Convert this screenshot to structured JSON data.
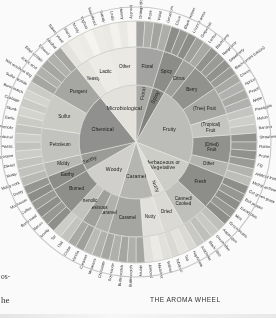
{
  "caption": "THE AROMA WHEEL",
  "page_fragments": {
    "left_top": "os-",
    "left_bottom": "he"
  },
  "colors": {
    "chemical": "#8e8e8c",
    "microbiological": "#e7e5df",
    "floral": "#a9a9a6",
    "spicy": "#7e7e7b",
    "fruity": "#bdbdb9",
    "herbaceous": "#cfcfca",
    "nutty": "#e3e1dc",
    "woody": "#d4d2cd",
    "earthy": "#9a9a97",
    "rim": "#c9c9c6",
    "background": "#ffffff"
  },
  "chart_data": {
    "type": "pie",
    "title": "THE AROMA WHEEL",
    "subtitle": "",
    "xlabel": "",
    "ylabel": "",
    "legend_position": "none",
    "grid": false,
    "rings": 3,
    "start_angle_deg": -90,
    "radii": {
      "inner": 0,
      "ring1_outer": 57,
      "ring2_outer": 95,
      "ring3_outer": 121
    },
    "categories": [
      "Floral",
      "Spicy",
      "Fruity",
      "Herbaceous or Vegetative",
      "Nutty",
      "Caramel",
      "Woody",
      "Earthy",
      "Chemical",
      "Microbiological"
    ],
    "values": [
      5,
      4,
      24,
      9,
      4,
      7,
      6,
      5,
      21,
      15
    ],
    "series": [
      {
        "name": "ring1",
        "values": [
          5,
          4,
          24,
          9,
          4,
          7,
          6,
          5,
          21,
          15
        ]
      }
    ],
    "sunburst": [
      {
        "label": "Floral",
        "color": "#a9a9a6",
        "span": 5,
        "children": [
          {
            "label": "Floral",
            "color": "#a3a3a0",
            "leaves": [
              "Orange blossom",
              "Rose",
              "Violet",
              "Geranium"
            ]
          }
        ]
      },
      {
        "label": "Spicy",
        "color": "#7e7e7b",
        "span": 4,
        "children": [
          {
            "label": "Spicy",
            "color": "#8a8a87",
            "leaves": [
              "Clove",
              "Black pepper",
              "Licorice anise"
            ]
          }
        ]
      },
      {
        "label": "Fruity",
        "color": "#bdbdb9",
        "span": 24,
        "children": [
          {
            "label": "Citrus",
            "color": "#9e9e9b",
            "leaves": [
              "Grapefruit",
              "Lemon"
            ]
          },
          {
            "label": "Berry",
            "color": "#8f8f8c",
            "leaves": [
              "Blackberry",
              "Raspberry",
              "Strawberry",
              "Blackcurrant (cassis)"
            ]
          },
          {
            "label": "(Tree) Fruit",
            "color": "#a8a8a5",
            "leaves": [
              "Cherry",
              "Apricot",
              "Peach",
              "Apple"
            ]
          },
          {
            "label": "(Tropical) Fruit",
            "color": "#c6c6c2",
            "leaves": [
              "Pineapple",
              "Melon",
              "Banana"
            ]
          },
          {
            "label": "(Dried) Fruit",
            "color": "#8f8f8c",
            "leaves": [
              "Strawberry jam",
              "Raisin",
              "Prune",
              "Fig"
            ]
          },
          {
            "label": "Other",
            "color": "#b4b4b0",
            "leaves": [
              "Artificial fruit",
              "Methyl anthranilate"
            ]
          }
        ]
      },
      {
        "label": "Herbaceous or Vegetative",
        "color": "#cfcfca",
        "span": 9,
        "children": [
          {
            "label": "Fresh",
            "color": "#8b8b88",
            "leaves": [
              "Cut green grass",
              "Bell pepper",
              "Eucalyptus",
              "Mint",
              "Green beans"
            ]
          },
          {
            "label": "Canned/ Cooked",
            "color": "#c0c0bc",
            "leaves": [
              "Asparagus",
              "Green olive",
              "Black olive",
              "Artichoke"
            ]
          }
        ]
      },
      {
        "label": "Nutty",
        "color": "#e3e1dc",
        "span": 4,
        "children": [
          {
            "label": "Dried",
            "color": "#dedcd7",
            "leaves": [
              "Hay/straw",
              "Tea",
              "Tobacco"
            ]
          }
        ]
      },
      {
        "label": "Caramel",
        "color": "#b6b6b2",
        "span": 7,
        "children": [
          {
            "label": "Nutty",
            "color": "#e6e4df",
            "leaves": [
              "Walnut",
              "Hazelnut",
              "Almond"
            ]
          },
          {
            "label": "Caramel",
            "color": "#a5a5a2",
            "leaves": [
              "Honey",
              "Butterscotch",
              "Butterscotch",
              "Soy sauce",
              "Chocolate"
            ]
          }
        ]
      },
      {
        "label": "Woody",
        "color": "#d4d2cd",
        "span": 6,
        "children": [
          {
            "label": "Caramel",
            "color": "#b0b0ac",
            "leaves": [
              "Molasses",
              "Caramel"
            ]
          },
          {
            "label": "Resinous",
            "color": "#9e9e9b",
            "leaves": [
              "Vanilla",
              "Cedar"
            ]
          },
          {
            "label": "Phenolic",
            "color": "#c4c4c0",
            "leaves": [
              "Oak",
              "Tar"
            ]
          },
          {
            "label": "Burned",
            "color": "#8c8c89",
            "leaves": [
              "Smoky",
              "Bacon",
              "Burnt toast",
              "Coffee"
            ]
          }
        ]
      },
      {
        "label": "Earthy",
        "color": "#9a9a97",
        "span": 5,
        "children": [
          {
            "label": "Earthy",
            "color": "#8a8a87",
            "leaves": [
              "Mushroom",
              "Dusty"
            ]
          },
          {
            "label": "Moldy",
            "color": "#b9b9b5",
            "leaves": [
              "Moldy cork",
              "Musty"
            ]
          }
        ]
      },
      {
        "label": "Chemical",
        "color": "#8e8e8c",
        "span": 21,
        "children": [
          {
            "label": "Petroleum",
            "color": "#c4c4c0",
            "leaves": [
              "Diesel",
              "Kerosene",
              "Plastic",
              "Medicinal",
              "Phenolic"
            ]
          },
          {
            "label": "Sulfur",
            "color": "#cdcdc8",
            "leaves": [
              "Garlic",
              "Skunk",
              "Cabbage",
              "Burnt match",
              "Sulfur dioxide"
            ]
          },
          {
            "label": "Pungent",
            "color": "#a6a6a3",
            "leaves": [
              "Wet wool/wet dog",
              "Acetic acid",
              "Ethyl acetate",
              "Ethanol",
              "Alcohol"
            ]
          }
        ]
      },
      {
        "label": "Microbiological",
        "color": "#e7e5df",
        "span": 15,
        "children": [
          {
            "label": "Yeasty",
            "color": "#e9e7e2",
            "leaves": [
              "Bakers yeast",
              "Sherry"
            ]
          },
          {
            "label": "Lactic",
            "color": "#f1efe9",
            "leaves": [
              "Moldy",
              "Yoghurt",
              "Sauerkraut"
            ]
          },
          {
            "label": "Other",
            "color": "#efede7",
            "leaves": [
              "Sweaty",
              "Leafy",
              "Horsey",
              "Mousey"
            ]
          }
        ]
      }
    ],
    "ring1_labels": [
      "Floral",
      "Spicy",
      "Fruity",
      "Herbaceous or Vegetative",
      "Nutty",
      "Caramel",
      "Woody",
      "Earthy",
      "Chemical",
      "Microbiological"
    ],
    "ring2_labels": [
      "Floral",
      "Spicy",
      "Citrus",
      "Berry",
      "(Tree) Fruit",
      "(Tropical) Fruit",
      "(Dried) Fruit",
      "Other",
      "Fresh",
      "Canned/ Cooked",
      "Dried",
      "Nutty",
      "Caramel",
      "Caramel",
      "Resinous",
      "Phenolic",
      "Burned",
      "Earthy",
      "Moldy",
      "Petroleum",
      "Sulfur",
      "Pungent",
      "Yeasty",
      "Lactic",
      "Other"
    ],
    "ring3_labels": [
      "Orange blossom",
      "Rose",
      "Violet",
      "Geranium",
      "Clove",
      "Black pepper",
      "Licorice anise",
      "Grapefruit",
      "Lemon",
      "Blackberry",
      "Raspberry",
      "Strawberry",
      "Blackcurrant (cassis)",
      "Cherry",
      "Apricot",
      "Peach",
      "Apple",
      "Pineapple",
      "Melon",
      "Banana",
      "Strawberry jam",
      "Raisin",
      "Prune",
      "Fig",
      "Artificial fruit",
      "Methyl anthranilate",
      "Cut green grass",
      "Bell pepper",
      "Eucalyptus",
      "Mint",
      "Green beans",
      "Asparagus",
      "Green olive",
      "Black olive",
      "Artichoke",
      "Hay/straw",
      "Tea",
      "Tobacco",
      "Walnut",
      "Hazelnut",
      "Almond",
      "Honey",
      "Butterscotch",
      "Soy sauce",
      "Chocolate",
      "Molasses",
      "Caramel",
      "Vanilla",
      "Cedar",
      "Oak",
      "Tar",
      "Bacon",
      "Smoky",
      "Burnt toast",
      "Coffee",
      "Medicinal",
      "Plastic",
      "Kerosene",
      "Diesel",
      "Moldy cork",
      "Musty",
      "Mushroom",
      "Dusty",
      "Garlic",
      "Skunk",
      "Cabbage",
      "Burnt match",
      "Sulfur dioxide",
      "Wet wool/wet dog",
      "Acetic acid",
      "Ethyl acetate",
      "Ethanol",
      "Alcohol",
      "Moldy",
      "Sherry",
      "Bakers yeast",
      "Sauerkraut",
      "Yoghurt",
      "Horsey",
      "Sweaty",
      "Leafy",
      "Mousey"
    ]
  }
}
